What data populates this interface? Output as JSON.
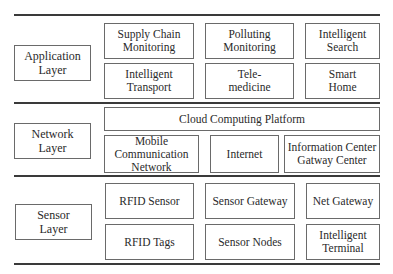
{
  "layers": [
    {
      "name": "Application\nLayer",
      "rows": [
        [
          "Supply Chain\nMonitoring",
          "Polluting\nMonitoring",
          "Intelligent\nSearch"
        ],
        [
          "Intelligent\nTransport",
          "Tele-\nmedicine",
          "Smart\nHome"
        ]
      ]
    },
    {
      "name": "Network\nLayer",
      "platform": "Cloud Computing Platform",
      "rows": [
        [
          "Mobile\nCommunication\nNetwork",
          "Internet",
          "Information Center\nGatway Center"
        ]
      ]
    },
    {
      "name": "Sensor\nLayer",
      "rows": [
        [
          "RFID Sensor",
          "Sensor Gateway",
          "Net Gateway"
        ],
        [
          "RFID Tags",
          "Sensor Nodes",
          "Intelligent\nTerminal"
        ]
      ]
    }
  ]
}
